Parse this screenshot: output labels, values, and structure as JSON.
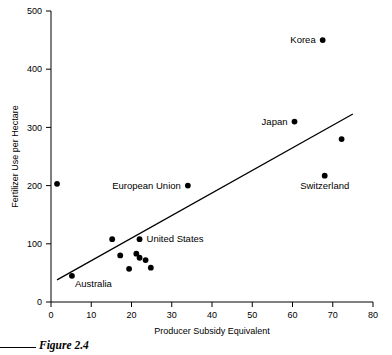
{
  "figure": {
    "caption": "Figure 2.4"
  },
  "chart_data": {
    "type": "scatter",
    "title": "",
    "xlabel": "Producer Subsidy Equivalent",
    "ylabel": "Fertilizer Use per Hectare",
    "xlim": [
      0,
      80
    ],
    "ylim": [
      0,
      500
    ],
    "xticks": [
      0,
      10,
      20,
      30,
      40,
      50,
      60,
      70,
      80
    ],
    "xtick_labels": [
      "0",
      "10",
      "20",
      "30",
      "40",
      "50",
      "60",
      "70",
      "80"
    ],
    "yticks": [
      0,
      100,
      200,
      300,
      400,
      500
    ],
    "ytick_labels": [
      "0",
      "100",
      "200",
      "300",
      "400",
      "500"
    ],
    "grid": false,
    "legend": "none",
    "points": [
      {
        "label": "",
        "x": 1.5,
        "y": 203,
        "label_pos": "none"
      },
      {
        "label": "Australia",
        "x": 5.2,
        "y": 45,
        "label_pos": "below-right"
      },
      {
        "label": "",
        "x": 15.2,
        "y": 108,
        "label_pos": "none"
      },
      {
        "label": "",
        "x": 17.2,
        "y": 80,
        "label_pos": "none"
      },
      {
        "label": "",
        "x": 19.4,
        "y": 57,
        "label_pos": "none"
      },
      {
        "label": "",
        "x": 21.2,
        "y": 83,
        "label_pos": "none"
      },
      {
        "label": "",
        "x": 22.0,
        "y": 76,
        "label_pos": "none"
      },
      {
        "label": "United States",
        "x": 22.0,
        "y": 108,
        "label_pos": "right"
      },
      {
        "label": "",
        "x": 23.5,
        "y": 72,
        "label_pos": "none"
      },
      {
        "label": "",
        "x": 24.8,
        "y": 59,
        "label_pos": "none"
      },
      {
        "label": "European Union",
        "x": 34.0,
        "y": 200,
        "label_pos": "left"
      },
      {
        "label": "Japan",
        "x": 60.5,
        "y": 310,
        "label_pos": "left"
      },
      {
        "label": "Korea",
        "x": 67.5,
        "y": 450,
        "label_pos": "left"
      },
      {
        "label": "Switzerland",
        "x": 68.0,
        "y": 217,
        "label_pos": "below"
      },
      {
        "label": "",
        "x": 72.2,
        "y": 280,
        "label_pos": "none"
      }
    ],
    "trend_line": {
      "x_start": 1.5,
      "y_start": 38,
      "x_end": 75.0,
      "y_end": 323
    },
    "marker_color": "#000000",
    "line_color": "#000000",
    "axis_color": "#000000"
  }
}
